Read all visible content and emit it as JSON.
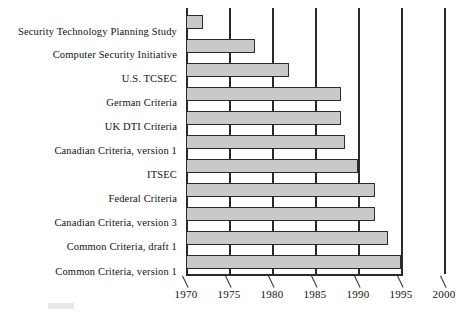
{
  "chart_data": {
    "type": "bar",
    "orientation": "horizontal",
    "title": "",
    "subtitle": "",
    "xlabel": "",
    "ylabel": "",
    "xlim": [
      1970,
      2000
    ],
    "ylim": null,
    "grid": true,
    "legend": null,
    "legend_position": "none",
    "bar_start_year": 1970,
    "categories": [
      "Security Technology  Planning Study",
      "Computer Security Initiative",
      "U.S. TCSEC",
      "German Criteria",
      "UK DTI Criteria",
      "Canadian Criteria, version 1",
      "ITSEC",
      "Federal Criteria",
      "Canadian Criteria, version 3",
      "Common Criteria, draft 1",
      "Common Criteria, version 1"
    ],
    "values": [
      1972,
      1978,
      1982,
      1988,
      1988,
      1988.5,
      1990,
      1992,
      1992,
      1993.5,
      1995
    ],
    "series": [
      {
        "name": "Criteria timeline end year",
        "values": [
          1972,
          1978,
          1982,
          1988,
          1988,
          1988.5,
          1990,
          1992,
          1992,
          1993.5,
          1995
        ]
      }
    ],
    "xticks": [
      1970,
      1975,
      1980,
      1985,
      1990,
      1995,
      2000
    ],
    "xtick_labels": [
      "1970",
      "1975",
      "1980",
      "1985",
      "1990",
      "1995",
      "2000"
    ],
    "bar_fill_color": "#c9c9c9",
    "bar_edge_color": "#2b2b2b",
    "axis_color": "#2a2a2a"
  },
  "axis": {
    "ticks": [
      {
        "label": "1970",
        "value": 1970
      },
      {
        "label": "1975",
        "value": 1975
      },
      {
        "label": "1980",
        "value": 1980
      },
      {
        "label": "1985",
        "value": 1985
      },
      {
        "label": "1990",
        "value": 1990
      },
      {
        "label": "1995",
        "value": 1995
      },
      {
        "label": "2000",
        "value": 2000
      }
    ]
  },
  "rows": [
    {
      "label": "Security Technology  Planning Study",
      "end": 1972
    },
    {
      "label": "Computer Security Initiative",
      "end": 1978
    },
    {
      "label": "U.S. TCSEC",
      "end": 1982
    },
    {
      "label": "German Criteria",
      "end": 1988
    },
    {
      "label": "UK DTI Criteria",
      "end": 1988
    },
    {
      "label": "Canadian Criteria, version 1",
      "end": 1988.5
    },
    {
      "label": "ITSEC",
      "end": 1990
    },
    {
      "label": "Federal Criteria",
      "end": 1992
    },
    {
      "label": "Canadian Criteria, version 3",
      "end": 1992
    },
    {
      "label": "Common Criteria, draft 1",
      "end": 1993.5
    },
    {
      "label": "Common Criteria, version 1",
      "end": 1995
    }
  ]
}
